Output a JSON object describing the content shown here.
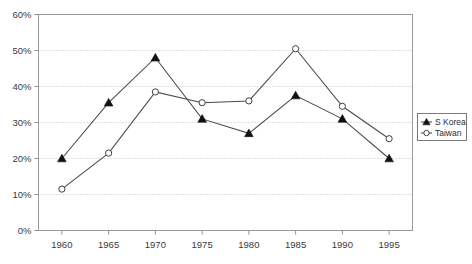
{
  "chart_data": {
    "type": "line",
    "title": "",
    "subtitle": "",
    "xlabel": "",
    "ylabel": "",
    "categories": [
      1960,
      1965,
      1970,
      1975,
      1980,
      1985,
      1990,
      1995
    ],
    "x_tick_labels": [
      "1960",
      "1965",
      "1970",
      "1975",
      "1980",
      "1985",
      "1990",
      "1995"
    ],
    "y_tick_labels": [
      "0%",
      "10%",
      "20%",
      "30%",
      "40%",
      "50%",
      "60%"
    ],
    "y_tick_values": [
      0,
      10,
      20,
      30,
      40,
      50,
      60
    ],
    "ylim": [
      0,
      60
    ],
    "xlim": [
      1957.5,
      1997.5
    ],
    "grid": "horizontal-dotted",
    "legend_position": "right-middle-outside",
    "series": [
      {
        "name": "S Korea",
        "marker": "filled-triangle",
        "values": [
          20.0,
          35.5,
          48.0,
          31.0,
          27.0,
          37.5,
          31.0,
          20.0
        ]
      },
      {
        "name": "Taiwan",
        "marker": "open-circle",
        "values": [
          11.5,
          21.5,
          38.5,
          35.5,
          36.0,
          50.5,
          34.5,
          25.5
        ]
      }
    ],
    "colors": {
      "series_line": "#4a4a4a",
      "marker_fill": "#111111",
      "marker_open": "#ffffff",
      "frame": "#9a9a9a",
      "grid": "#b9b9b9",
      "background": "#ffffff"
    }
  },
  "legend": {
    "entries": [
      {
        "label": "S Korea",
        "marker": "filled-triangle"
      },
      {
        "label": "Taiwan",
        "marker": "open-circle"
      }
    ]
  }
}
